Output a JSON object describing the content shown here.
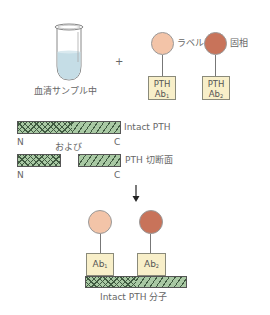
{
  "sample": {
    "label": "血清サンプル中"
  },
  "plus": "+",
  "reagents": {
    "label_circle": {
      "caption": "ラベル",
      "color": "#f3c4a8"
    },
    "solid_circle": {
      "caption": "固相",
      "color": "#c8735a"
    },
    "ab1": {
      "line1": "PTH",
      "line2": "Ab",
      "sub": "1"
    },
    "ab2": {
      "line1": "PTH",
      "line2": "Ab",
      "sub": "2"
    }
  },
  "fragments": {
    "intact_label": "Intact PTH",
    "n1": "N",
    "c1": "C",
    "and_label": "および",
    "fragment_label": "PTH 切断面",
    "n2": "N",
    "c2": "C"
  },
  "arrow": "↓",
  "result": {
    "ab1": {
      "text": "Ab",
      "sub": "1"
    },
    "ab2": {
      "text": "Ab",
      "sub": "2"
    },
    "caption": "Intact PTH 分子"
  },
  "colors": {
    "label_circle": "#f3c4a8",
    "solid_circle": "#c8735a",
    "antibody_box": "#f8efc9",
    "peptide_green": "#a9c9a4",
    "tube_liquid": "#c5dde6"
  }
}
